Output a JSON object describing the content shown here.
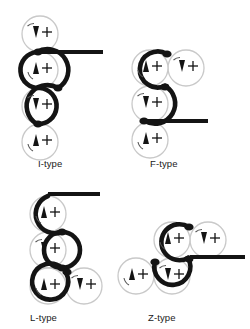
{
  "figure": {
    "title": "",
    "background": "#ffffff",
    "ink": "#141414",
    "ghost": "#c9c9c9",
    "panels": [
      {
        "id": "i-type",
        "label": "I-type",
        "label_x": 38,
        "label_y": 158,
        "origin_x": 0,
        "origin_y": 0,
        "nodes": [
          {
            "cx": 40,
            "cy": 34,
            "r": 18,
            "spin": "down",
            "state": "ghost"
          },
          {
            "cx": 40,
            "cy": 70,
            "r": 18,
            "spin": "up",
            "state": "active"
          },
          {
            "cx": 40,
            "cy": 106,
            "r": 18,
            "spin": "down",
            "state": "active"
          },
          {
            "cx": 40,
            "cy": 142,
            "r": 18,
            "spin": "up",
            "state": "ghost"
          }
        ],
        "joints": [
          {
            "cx": 37,
            "cy": 52
          },
          {
            "cx": 58,
            "cy": 88
          },
          {
            "cx": 37,
            "cy": 124
          }
        ],
        "stem": {
          "x1": 37,
          "y1": 52,
          "x2": 103,
          "y2": 52
        }
      },
      {
        "id": "f-type",
        "label": "F-type",
        "label_x": 150,
        "label_y": 158,
        "origin_x": 0,
        "origin_y": 0,
        "nodes": [
          {
            "cx": 150,
            "cy": 68,
            "r": 18,
            "spin": "up",
            "state": "active"
          },
          {
            "cx": 186,
            "cy": 68,
            "r": 18,
            "spin": "down",
            "state": "ghost"
          },
          {
            "cx": 150,
            "cy": 104,
            "r": 18,
            "spin": "down",
            "state": "active"
          },
          {
            "cx": 150,
            "cy": 140,
            "r": 18,
            "spin": "up",
            "state": "ghost"
          }
        ],
        "joints": [
          {
            "cx": 167,
            "cy": 54
          },
          {
            "cx": 165,
            "cy": 86
          },
          {
            "cx": 145,
            "cy": 121
          }
        ],
        "stem": {
          "x1": 143,
          "y1": 121,
          "x2": 208,
          "y2": 121
        }
      },
      {
        "id": "l-type",
        "label": "L-type",
        "label_x": 30,
        "label_y": 312,
        "origin_x": 0,
        "origin_y": 0,
        "nodes": [
          {
            "cx": 48,
            "cy": 214,
            "r": 18,
            "spin": "up",
            "state": "active"
          },
          {
            "cx": 48,
            "cy": 250,
            "r": 18,
            "spin": "down",
            "state": "active"
          },
          {
            "cx": 48,
            "cy": 286,
            "r": 18,
            "spin": "up",
            "state": "active"
          },
          {
            "cx": 84,
            "cy": 286,
            "r": 18,
            "spin": "down",
            "state": "ghost"
          }
        ],
        "joints": [
          {
            "cx": 62,
            "cy": 232
          },
          {
            "cx": 62,
            "cy": 268
          },
          {
            "cx": 68,
            "cy": 273
          }
        ],
        "stem": {
          "x1": 48,
          "y1": 196,
          "x2": 100,
          "y2": 196
        }
      },
      {
        "id": "z-type",
        "label": "Z-type",
        "label_x": 148,
        "label_y": 312,
        "origin_x": 0,
        "origin_y": 0,
        "nodes": [
          {
            "cx": 172,
            "cy": 240,
            "r": 18,
            "spin": "up",
            "state": "active"
          },
          {
            "cx": 208,
            "cy": 240,
            "r": 18,
            "spin": "down",
            "state": "ghost"
          },
          {
            "cx": 172,
            "cy": 276,
            "r": 18,
            "spin": "down",
            "state": "active"
          },
          {
            "cx": 136,
            "cy": 276,
            "r": 18,
            "spin": "up",
            "state": "ghost"
          }
        ],
        "joints": [
          {
            "cx": 189,
            "cy": 227
          },
          {
            "cx": 188,
            "cy": 259
          },
          {
            "cx": 155,
            "cy": 262
          }
        ],
        "stem": {
          "x1": 190,
          "y1": 258,
          "x2": 245,
          "y2": 258
        }
      }
    ],
    "glyphs": {
      "spin_up": "up-triangle-arrow",
      "spin_down": "down-triangle-arrow",
      "charge": "plus-cross",
      "rotation": "curved-arc-arrow"
    }
  }
}
